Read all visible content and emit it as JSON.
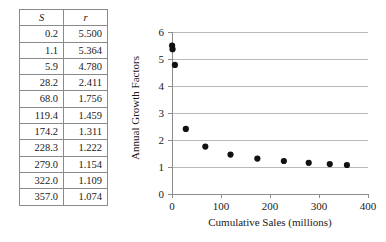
{
  "table": {
    "headers": [
      "S",
      "r"
    ],
    "rows": [
      {
        "s": "0.2",
        "r": "5.500"
      },
      {
        "s": "1.1",
        "r": "5.364"
      },
      {
        "s": "5.9",
        "r": "4.780"
      },
      {
        "s": "28.2",
        "r": "2.411"
      },
      {
        "s": "68.0",
        "r": "1.756"
      },
      {
        "s": "119.4",
        "r": "1.459"
      },
      {
        "s": "174.2",
        "r": "1.311"
      },
      {
        "s": "228.3",
        "r": "1.222"
      },
      {
        "s": "279.0",
        "r": "1.154"
      },
      {
        "s": "322.0",
        "r": "1.109"
      },
      {
        "s": "357.0",
        "r": "1.074"
      }
    ]
  },
  "chart_data": {
    "type": "scatter",
    "title": "",
    "xlabel": "Cumulative Sales (millions)",
    "ylabel": "Annual Growth Factors",
    "xlim": [
      0,
      400
    ],
    "ylim": [
      0,
      6
    ],
    "xticks": [
      0,
      100,
      200,
      300,
      400
    ],
    "yticks": [
      0,
      1,
      2,
      3,
      4,
      5,
      6
    ],
    "xtick_labels": [
      "0",
      "100",
      "200",
      "300",
      "400"
    ],
    "ytick_labels": [
      "0",
      "1",
      "2",
      "3",
      "4",
      "5",
      "6"
    ],
    "grid": "horizontal",
    "legend": "none",
    "marker": "filled-circle",
    "marker_color": "#111111",
    "x": [
      0.2,
      1.1,
      5.9,
      28.2,
      68.0,
      119.4,
      174.2,
      228.3,
      279.0,
      322.0,
      357.0
    ],
    "y": [
      5.5,
      5.364,
      4.78,
      2.411,
      1.756,
      1.459,
      1.311,
      1.222,
      1.154,
      1.109,
      1.074
    ]
  }
}
